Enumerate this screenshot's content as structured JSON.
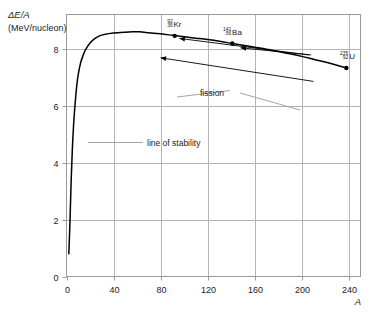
{
  "chart_data": {
    "type": "line",
    "title": "",
    "xlabel": "A",
    "ylabel": "ΔE/A",
    "ylabel_units": "(MeV/nucleon)",
    "xlim": [
      0,
      250
    ],
    "ylim": [
      0,
      9.2
    ],
    "xticks": [
      "0",
      "40",
      "80",
      "120",
      "160",
      "200",
      "240"
    ],
    "xtick_values": [
      0,
      40,
      80,
      120,
      160,
      200,
      240
    ],
    "yticks": [
      "0",
      "2",
      "4",
      "6",
      "8"
    ],
    "ytick_values": [
      0,
      2,
      4,
      6,
      8
    ],
    "grid": true,
    "legend": "none",
    "series": [
      {
        "name": "binding energy per nucleon curve",
        "points": [
          [
            2,
            0.8
          ],
          [
            3,
            2.0
          ],
          [
            4,
            3.4
          ],
          [
            5,
            4.5
          ],
          [
            6,
            5.3
          ],
          [
            7,
            5.9
          ],
          [
            8,
            6.4
          ],
          [
            9,
            6.8
          ],
          [
            10,
            7.1
          ],
          [
            12,
            7.5
          ],
          [
            14,
            7.75
          ],
          [
            16,
            7.95
          ],
          [
            20,
            8.2
          ],
          [
            24,
            8.35
          ],
          [
            28,
            8.45
          ],
          [
            32,
            8.5
          ],
          [
            40,
            8.55
          ],
          [
            50,
            8.58
          ],
          [
            56,
            8.59
          ],
          [
            62,
            8.59
          ],
          [
            70,
            8.56
          ],
          [
            80,
            8.52
          ],
          [
            90,
            8.47
          ],
          [
            100,
            8.42
          ],
          [
            110,
            8.37
          ],
          [
            120,
            8.32
          ],
          [
            130,
            8.26
          ],
          [
            141,
            8.18
          ],
          [
            150,
            8.12
          ],
          [
            160,
            8.05
          ],
          [
            170,
            7.98
          ],
          [
            180,
            7.9
          ],
          [
            190,
            7.82
          ],
          [
            200,
            7.73
          ],
          [
            210,
            7.63
          ],
          [
            220,
            7.53
          ],
          [
            230,
            7.42
          ],
          [
            238,
            7.32
          ]
        ]
      }
    ],
    "data_points": [
      {
        "label": "Kr",
        "mass_number": "92",
        "atomic_number": "36",
        "A": 92,
        "value": 8.45
      },
      {
        "label": "Ba",
        "mass_number": "141",
        "atomic_number": "56",
        "A": 141,
        "value": 8.18
      },
      {
        "label": "U",
        "mass_number": "235",
        "atomic_number": "92",
        "A": 238,
        "value": 7.32
      }
    ],
    "annotations": [
      {
        "name": "fission",
        "text": "fission"
      },
      {
        "name": "line-of-stability",
        "text": "line of stability"
      }
    ],
    "arrows": [
      {
        "name": "upper-fission-arrow",
        "from_A": 206,
        "from_value": 7.78,
        "to_A": 96,
        "to_value": 8.36
      },
      {
        "name": "lower-fission-arrow",
        "from_A": 210,
        "from_value": 6.85,
        "to_A": 80,
        "to_value": 7.68
      },
      {
        "name": "ba-fission-arrow",
        "from_A": 208,
        "from_value": 7.78,
        "to_A": 148,
        "to_value": 8.03
      }
    ]
  },
  "colors": {
    "curve": "#000000",
    "grid": "#b4b4b4",
    "frame": "#9a9a9a",
    "text": "#1a1a1a",
    "background": "#ffffff"
  }
}
